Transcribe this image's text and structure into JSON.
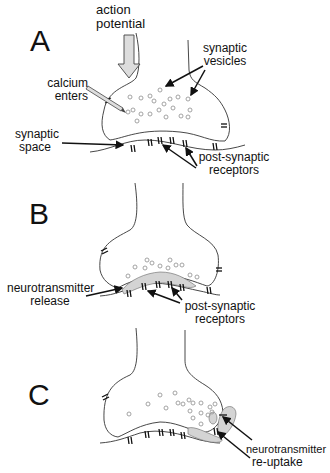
{
  "panels": [
    {
      "letter": "A",
      "labels": {
        "action_line1": "action",
        "action_line2": "potential",
        "calcium_line1": "calcium",
        "calcium_line2": "enters",
        "vesicles_line1": "synaptic",
        "vesicles_line2": "vesicles",
        "space_line1": "synaptic",
        "space_line2": "space",
        "receptors_line1": "post-synaptic",
        "receptors_line2": "receptors"
      }
    },
    {
      "letter": "B",
      "labels": {
        "release_line1": "neurotransmitter",
        "release_line2": "release",
        "receptors_line1": "post-synaptic",
        "receptors_line2": "receptors"
      }
    },
    {
      "letter": "C",
      "labels": {
        "reuptake_line1": "neurotransmitter",
        "reuptake_line2": "re-uptake"
      }
    }
  ],
  "colors": {
    "line": "#222222",
    "vesicle": "#999999",
    "fill_gray": "#d4d4d4"
  }
}
